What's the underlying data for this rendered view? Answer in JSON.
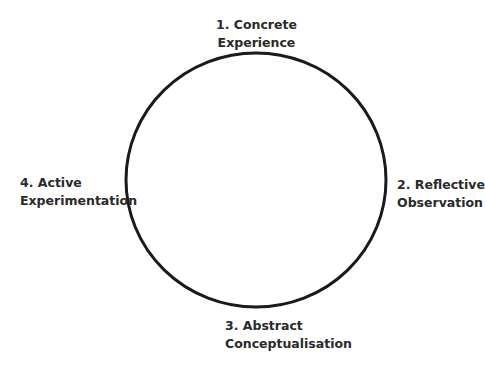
{
  "diagram": {
    "type": "cycle",
    "circle": {
      "cx": 256,
      "cy": 180,
      "rx": 130,
      "ry": 127,
      "stroke": "#1a1a1a",
      "stroke_width": 3
    },
    "stages": [
      {
        "number": "1.",
        "line1": "1. Concrete",
        "line2": "Experience",
        "position": "top"
      },
      {
        "number": "2.",
        "line1": "2. Reflective",
        "line2": "Observation",
        "position": "right"
      },
      {
        "number": "3.",
        "line1": "3. Abstract",
        "line2": "Conceptualisation",
        "position": "bottom"
      },
      {
        "number": "4.",
        "line1": "4. Active",
        "line2": "Experimentation",
        "position": "left"
      }
    ]
  }
}
